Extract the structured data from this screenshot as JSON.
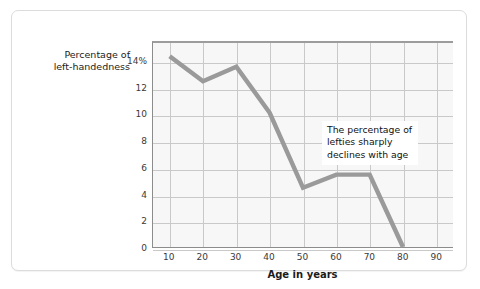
{
  "chart_data": {
    "type": "line",
    "title": "",
    "xlabel": "Age in years",
    "ylabel": "Percentage of\nleft-handedness",
    "x": [
      10,
      20,
      30,
      40,
      50,
      60,
      70,
      80
    ],
    "values": [
      14.5,
      12.6,
      13.7,
      10.2,
      4.5,
      5.5,
      5.5,
      0
    ],
    "series": [
      {
        "name": "Percentage of left-handedness",
        "values": [
          14.5,
          12.6,
          13.7,
          10.2,
          4.5,
          5.5,
          5.5,
          0
        ]
      }
    ],
    "xlim": [
      5,
      95
    ],
    "ylim": [
      0,
      15.5
    ],
    "x_ticks": [
      "10",
      "20",
      "30",
      "40",
      "50",
      "60",
      "70",
      "80",
      "90"
    ],
    "x_tick_values": [
      10,
      20,
      30,
      40,
      50,
      60,
      70,
      80,
      90
    ],
    "y_ticks": [
      "0",
      "2",
      "4",
      "6",
      "8",
      "10",
      "12",
      "14%"
    ],
    "y_tick_values": [
      0,
      2,
      4,
      6,
      8,
      10,
      12,
      14
    ],
    "grid": true,
    "legend": "none",
    "annotations": [
      {
        "text": "The percentage of\nlefties sharply\ndeclines with age"
      }
    ],
    "colors": {
      "line": "#9a9a9a",
      "grid": "#c9c9c9",
      "plot_background": "#f7f7f7",
      "axis": "#8c8c8c",
      "card_border": "#dcdcdc",
      "text": "#1b1b1b"
    }
  },
  "axis_titles": {
    "y": "Percentage of\nleft-handedness",
    "x": "Age in years"
  },
  "annotation": {
    "text": "The percentage of\nlefties sharply\ndeclines with age"
  }
}
